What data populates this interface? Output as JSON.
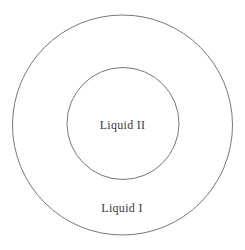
{
  "diagram": {
    "type": "concentric-circles",
    "labels": {
      "inner": "Liquid II",
      "outer": "Liquid I"
    },
    "colors": {
      "stroke": "#787878",
      "text": "#3a3a3a",
      "background": "#ffffff"
    }
  }
}
